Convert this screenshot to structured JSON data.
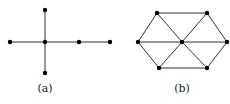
{
  "figures": [
    {
      "id": "a",
      "label": "(a)",
      "label_pos": [
        45,
        92
      ],
      "type": "tree",
      "nodes": [
        {
          "id": "a_top",
          "x": 45,
          "y": 10
        },
        {
          "id": "a_left",
          "x": 10,
          "y": 42
        },
        {
          "id": "a_center",
          "x": 45,
          "y": 42
        },
        {
          "id": "a_right1",
          "x": 79,
          "y": 42
        },
        {
          "id": "a_right2",
          "x": 110,
          "y": 42
        },
        {
          "id": "a_bottom",
          "x": 45,
          "y": 73
        }
      ],
      "edges": [
        [
          "a_top",
          "a_center"
        ],
        [
          "a_center",
          "a_bottom"
        ],
        [
          "a_left",
          "a_center"
        ],
        [
          "a_center",
          "a_right1"
        ],
        [
          "a_right1",
          "a_right2"
        ]
      ]
    },
    {
      "id": "b",
      "label": "(b)",
      "label_pos": [
        182,
        92
      ],
      "type": "wheel-hexagon",
      "nodes": [
        {
          "id": "b_topleft",
          "x": 157,
          "y": 13
        },
        {
          "id": "b_topright",
          "x": 207,
          "y": 13
        },
        {
          "id": "b_left",
          "x": 138,
          "y": 42
        },
        {
          "id": "b_center",
          "x": 182,
          "y": 42
        },
        {
          "id": "b_right",
          "x": 227,
          "y": 42
        },
        {
          "id": "b_bottomleft",
          "x": 159,
          "y": 68
        },
        {
          "id": "b_bottomright",
          "x": 207,
          "y": 68
        }
      ],
      "edges": [
        [
          "b_topleft",
          "b_topright"
        ],
        [
          "b_topright",
          "b_right"
        ],
        [
          "b_right",
          "b_bottomright"
        ],
        [
          "b_bottomright",
          "b_bottomleft"
        ],
        [
          "b_bottomleft",
          "b_left"
        ],
        [
          "b_left",
          "b_topleft"
        ],
        [
          "b_center",
          "b_topleft"
        ],
        [
          "b_center",
          "b_topright"
        ],
        [
          "b_center",
          "b_left"
        ],
        [
          "b_center",
          "b_right"
        ],
        [
          "b_center",
          "b_bottomleft"
        ],
        [
          "b_center",
          "b_bottomright"
        ]
      ]
    }
  ],
  "style": {
    "edge_color": "#333333",
    "node_color": "#000000",
    "node_radius": 2.2
  }
}
